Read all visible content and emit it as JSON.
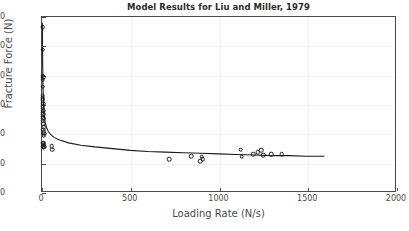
{
  "chart_data": {
    "type": "scatter",
    "title": "Model Results for Liu and Miller, 1979",
    "xlabel": "Loading Rate (N/s)",
    "ylabel": "Fracture Force (N)",
    "xlim": [
      0,
      2000
    ],
    "ylim": [
      0,
      300
    ],
    "xticks": [
      0,
      500,
      1000,
      1500,
      2000
    ],
    "yticks": [
      0,
      50,
      100,
      150,
      200,
      250,
      300
    ],
    "xtick_labels": [
      "0",
      "500",
      "1000",
      "1500",
      "2000"
    ],
    "ytick_labels": [
      "0",
      "50",
      "100",
      "150",
      "200",
      "250",
      "300"
    ],
    "grid": true,
    "legend": false,
    "marker_color": "#1a1a1a",
    "line_color": "#1a1a1a",
    "axis_color": "#4a4a4a",
    "background_color": "#ffffff",
    "series": [
      {
        "name": "Experimental Data",
        "type": "scatter",
        "marker": "open-circle",
        "points": [
          [
            3,
            283
          ],
          [
            4,
            244
          ],
          [
            3,
            200
          ],
          [
            6,
            197
          ],
          [
            4,
            193
          ],
          [
            5,
            181
          ],
          [
            4,
            166
          ],
          [
            5,
            162
          ],
          [
            4,
            158
          ],
          [
            6,
            152
          ],
          [
            5,
            148
          ],
          [
            4,
            144
          ],
          [
            6,
            140
          ],
          [
            5,
            137
          ],
          [
            7,
            134
          ],
          [
            5,
            130
          ],
          [
            6,
            127
          ],
          [
            4,
            123
          ],
          [
            7,
            118
          ],
          [
            9,
            112
          ],
          [
            8,
            108
          ],
          [
            10,
            104
          ],
          [
            12,
            101
          ],
          [
            9,
            98
          ],
          [
            6,
            86
          ],
          [
            8,
            84
          ],
          [
            10,
            82
          ],
          [
            7,
            80
          ],
          [
            12,
            79
          ],
          [
            9,
            77
          ],
          [
            55,
            80
          ],
          [
            57,
            74
          ],
          [
            715,
            58
          ],
          [
            840,
            63
          ],
          [
            890,
            54
          ],
          [
            900,
            62
          ],
          [
            905,
            58
          ],
          [
            1120,
            74
          ],
          [
            1125,
            62
          ],
          [
            1190,
            66
          ],
          [
            1215,
            70
          ],
          [
            1235,
            73
          ],
          [
            1245,
            64
          ],
          [
            1290,
            66
          ],
          [
            1350,
            66
          ]
        ]
      },
      {
        "name": "Model Fit",
        "type": "line",
        "points": [
          [
            2,
            290
          ],
          [
            4,
            215
          ],
          [
            6,
            175
          ],
          [
            9,
            148
          ],
          [
            13,
            130
          ],
          [
            18,
            118
          ],
          [
            25,
            110
          ],
          [
            35,
            103
          ],
          [
            50,
            97
          ],
          [
            70,
            92
          ],
          [
            100,
            88
          ],
          [
            150,
            83
          ],
          [
            220,
            79
          ],
          [
            300,
            76
          ],
          [
            400,
            73
          ],
          [
            500,
            70
          ],
          [
            600,
            68
          ],
          [
            700,
            67
          ],
          [
            800,
            66
          ],
          [
            900,
            65
          ],
          [
            1000,
            64
          ],
          [
            1100,
            63
          ],
          [
            1200,
            62
          ],
          [
            1300,
            61
          ],
          [
            1400,
            61
          ],
          [
            1500,
            60
          ],
          [
            1600,
            60
          ]
        ]
      }
    ]
  }
}
